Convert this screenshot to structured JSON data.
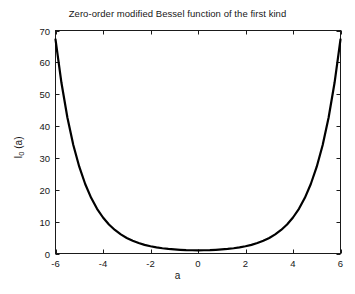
{
  "figure": {
    "background_color": "#ffffff",
    "axis_color": "#1a1a1a",
    "curve_color": "#000000"
  },
  "chart_data": {
    "type": "line",
    "title": "Zero-order modified Bessel function of the first kind",
    "xlabel": "a",
    "ylabel_text": "I",
    "ylabel_sub": "0",
    "ylabel_tail": " (a)",
    "ylabel_full": "I0 (a)",
    "xlim": [
      -6,
      6
    ],
    "ylim": [
      0,
      70
    ],
    "grid": false,
    "legend": null,
    "xticks": [
      -6,
      -4,
      -2,
      0,
      2,
      4,
      6
    ],
    "xtick_labels": [
      "-6",
      "-4",
      "-2",
      "0",
      "2",
      "4",
      "6"
    ],
    "yticks": [
      0,
      10,
      20,
      30,
      40,
      50,
      60,
      70
    ],
    "ytick_labels": [
      "0",
      "10",
      "20",
      "30",
      "40",
      "50",
      "60",
      "70"
    ],
    "series": [
      {
        "name": "I0(a)",
        "color": "#000000",
        "line_width": 2.2,
        "x": [
          -6,
          -5.75,
          -5.5,
          -5.25,
          -5,
          -4.75,
          -4.5,
          -4.25,
          -4,
          -3.75,
          -3.5,
          -3.25,
          -3,
          -2.75,
          -2.5,
          -2.25,
          -2,
          -1.75,
          -1.5,
          -1.25,
          -1,
          -0.75,
          -0.5,
          -0.25,
          0,
          0.25,
          0.5,
          0.75,
          1,
          1.25,
          1.5,
          1.75,
          2,
          2.25,
          2.5,
          2.75,
          3,
          3.25,
          3.5,
          3.75,
          4,
          4.25,
          4.5,
          4.75,
          5,
          5.25,
          5.5,
          5.75,
          6
        ],
        "y": [
          67.23,
          53.59,
          42.69,
          34.06,
          27.24,
          21.82,
          17.48,
          14.04,
          11.3,
          9.12,
          7.38,
          5.99,
          4.88,
          3.99,
          3.29,
          2.72,
          2.28,
          1.92,
          1.65,
          1.43,
          1.27,
          1.15,
          1.06,
          1.02,
          1.0,
          1.02,
          1.06,
          1.15,
          1.27,
          1.43,
          1.65,
          1.92,
          2.28,
          2.72,
          3.29,
          3.99,
          4.88,
          5.99,
          7.38,
          9.12,
          11.3,
          14.04,
          17.48,
          21.82,
          27.24,
          34.06,
          42.69,
          53.59,
          67.23
        ]
      }
    ]
  }
}
